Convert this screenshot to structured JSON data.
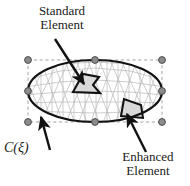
{
  "figure": {
    "background_color": "#ffffff",
    "labels": {
      "standard_element": {
        "line1": "Standard",
        "line2": "Element"
      },
      "enhanced_element": {
        "line1": "Enhanced",
        "line2": "Element"
      },
      "boundary_curve": "C(ξ)"
    },
    "colors": {
      "boundary_curve": "#111111",
      "mesh_lines": "#b3b3b3",
      "control_polygon": "#9a9a9a",
      "control_point_fill": "#8c8c8c",
      "control_point_stroke": "#4d4d4d",
      "arrow": "#111111",
      "highlight_standard_fill": "#d9d9d9",
      "highlight_standard_stroke": "#111111",
      "highlight_enhanced_fill": "#d9d9d9",
      "highlight_enhanced_stroke": "#111111",
      "text": "#1a1a1a"
    },
    "geometry": {
      "ellipse": {
        "cx": 95,
        "cy": 91,
        "rx": 67,
        "ry": 31
      },
      "control_polygon_rect": {
        "x": 28,
        "y": 60,
        "width": 134,
        "height": 62
      },
      "control_points": [
        {
          "id": "cp-top-left",
          "x": 28,
          "y": 60
        },
        {
          "id": "cp-top-center",
          "x": 95,
          "y": 60
        },
        {
          "id": "cp-top-right",
          "x": 162,
          "y": 60
        },
        {
          "id": "cp-mid-left",
          "x": 28,
          "y": 91
        },
        {
          "id": "cp-mid-right",
          "x": 162,
          "y": 91
        },
        {
          "id": "cp-bottom-left",
          "x": 28,
          "y": 122
        },
        {
          "id": "cp-bottom-center",
          "x": 95,
          "y": 122
        },
        {
          "id": "cp-bottom-right",
          "x": 162,
          "y": 122
        }
      ],
      "control_point_radius": 3.4,
      "arrows": [
        {
          "id": "arrow-standard",
          "x1": 55,
          "y1": 39,
          "x2": 84,
          "y2": 84
        },
        {
          "id": "arrow-curve",
          "x1": 50,
          "y1": 150,
          "x2": 41,
          "y2": 117
        },
        {
          "id": "arrow-enhanced",
          "x1": 146,
          "y1": 152,
          "x2": 127,
          "y2": 114
        }
      ],
      "highlight_standard": "M 73,92 L 83,74 L 99,77 L 93,85 L 100,93 Z",
      "highlight_enhanced": "M 121,116 L 124,99 L 141,105 L 143,118 Z"
    }
  }
}
